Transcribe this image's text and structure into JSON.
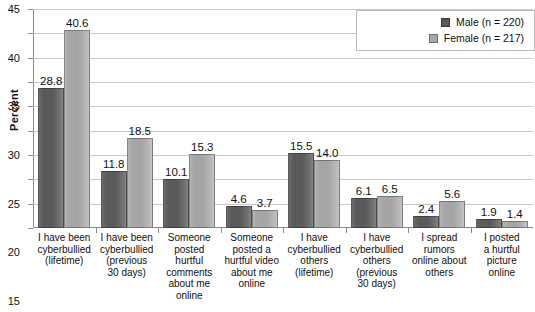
{
  "chart_data": {
    "type": "bar",
    "title": "",
    "xlabel": "",
    "ylabel": "Percent",
    "ylim": [
      0,
      45
    ],
    "ytick_step": 5,
    "yticks": [
      0,
      5,
      10,
      15,
      20,
      25,
      30,
      35,
      40,
      45
    ],
    "grid": true,
    "legend_position": "top-right",
    "categories": [
      "I have been cyberbullied (lifetime)",
      "I have been cyberbullied (previous 30 days)",
      "Someone posted hurtful comments about me online",
      "Someone posted a hurtful video about me online",
      "I have cyberbullied others (lifetime)",
      "I have cyberbullied others (previous 30 days)",
      "I spread rumors online about others",
      "I posted a hurtful picture online"
    ],
    "category_lines": [
      [
        "I have been",
        "cyberbullied",
        "(lifetime)"
      ],
      [
        "I have been",
        "cyberbullied",
        "(previous",
        "30 days)"
      ],
      [
        "Someone",
        "posted",
        "hurtful",
        "comments",
        "about me",
        "online"
      ],
      [
        "Someone",
        "posted a",
        "hurtful video",
        "about me",
        "online"
      ],
      [
        "I have",
        "cyberbullied",
        "others",
        "(lifetime)"
      ],
      [
        "I have",
        "cyberbullied",
        "others",
        "(previous",
        "30 days)"
      ],
      [
        "I spread",
        "rumors",
        "online about",
        "others"
      ],
      [
        "I posted",
        "a hurtful",
        "picture",
        "online"
      ]
    ],
    "series": [
      {
        "name": "Male (n = 220)",
        "short_name": "Male",
        "color": "#595959",
        "values": [
          28.8,
          11.8,
          10.1,
          4.6,
          15.5,
          6.1,
          2.4,
          1.9
        ]
      },
      {
        "name": "Female (n = 217)",
        "short_name": "Female",
        "color": "#a6a6a6",
        "values": [
          40.6,
          18.5,
          15.3,
          3.7,
          14.0,
          6.5,
          5.6,
          1.4
        ]
      }
    ]
  },
  "legend": {
    "items": [
      {
        "label": "Male (n = 220)",
        "swatch": "male"
      },
      {
        "label": "Female (n = 217)",
        "swatch": "female"
      }
    ]
  }
}
